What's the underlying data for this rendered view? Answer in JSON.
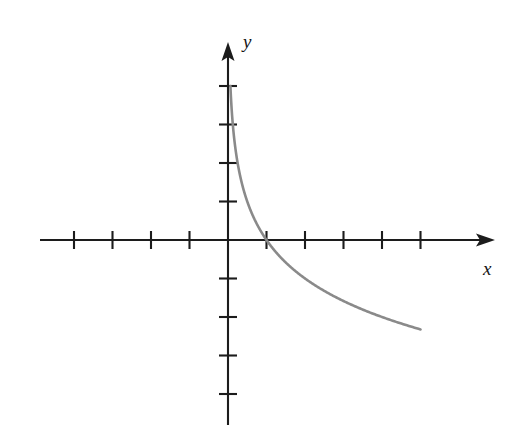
{
  "figure": {
    "title": "",
    "background_color": "#ffffff",
    "axis_color": "#1c1c1c",
    "curve_color": "#8a8a8a"
  },
  "labels": {
    "x_axis": "x",
    "y_axis": "y"
  },
  "chart_data": {
    "type": "line",
    "title": "",
    "subtitle": "",
    "xlabel": "x",
    "ylabel": "y",
    "function": "y = -log2(x)",
    "xlim": [
      -4.9,
      6.9
    ],
    "ylim": [
      -5.1,
      5.1
    ],
    "x_axis_range_drawn": [
      -4.9,
      6.9
    ],
    "y_axis_range_drawn": [
      -4.8,
      5.1
    ],
    "grid": false,
    "legend": null,
    "x_ticks": [
      -4,
      -3,
      -2,
      -1,
      1,
      2,
      3,
      4,
      5
    ],
    "y_ticks": [
      -4,
      -3,
      -2,
      -1,
      1,
      2,
      3,
      4
    ],
    "tick_labels_shown": false,
    "unit_pixels": 38.5,
    "origin_pixels": [
      228,
      240
    ],
    "x_intercept": 1,
    "vertical_asymptote": 0,
    "domain_drawn": [
      0.0625,
      5.0
    ],
    "series": [
      {
        "name": "y = -log2(x)",
        "color": "#8a8a8a",
        "x": [
          0.0625,
          0.09,
          0.125,
          0.18,
          0.25,
          0.35,
          0.5,
          0.7,
          1.0,
          1.4,
          2.0,
          2.8,
          3.5,
          4.2,
          5.0
        ],
        "y": [
          4.0,
          3.47,
          3.0,
          2.47,
          2.0,
          1.51,
          1.0,
          0.51,
          0.0,
          -0.49,
          -1.0,
          -1.49,
          -1.81,
          -2.07,
          -2.32
        ]
      }
    ]
  }
}
